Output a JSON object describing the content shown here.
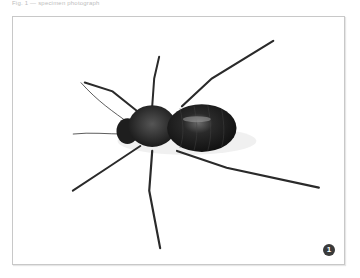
{
  "caption": "Fig. 1 — specimen photograph",
  "figure": {
    "background_color": "#ffffff",
    "frame_color": "#c8c8c8"
  },
  "badge": {
    "label": "1",
    "color": "#3a3a3a"
  }
}
